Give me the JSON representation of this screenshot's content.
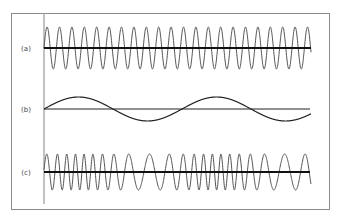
{
  "figure": {
    "panels": [
      {
        "label": "(a)",
        "description": "carrier wave"
      },
      {
        "label": "(b)",
        "description": "modulating signal"
      },
      {
        "label": "(c)",
        "description": "frequency-modulated wave"
      }
    ]
  },
  "colors": {
    "border": "#8a8a8a",
    "axis": "#9a9a9a",
    "wave": "#555555",
    "baseline": "#111111"
  }
}
